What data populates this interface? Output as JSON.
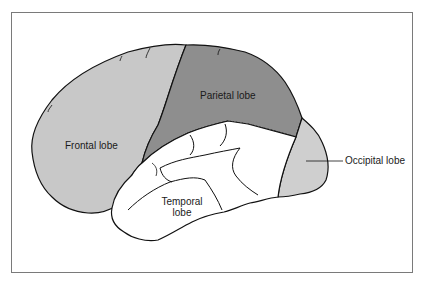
{
  "figure": {
    "type": "lateral-view brain diagram",
    "labels": {
      "frontal": "Frontal lobe",
      "parietal": "Parietal lobe",
      "temporal_line1": "Temporal",
      "temporal_line2": "lobe",
      "occipital": "Occipital lobe"
    },
    "colors": {
      "frontal": "#c8c8c8",
      "parietal": "#8e8e8e",
      "temporal": "#ffffff",
      "occipital": "#cfcfcf",
      "outline": "#111111",
      "frame": "#7a7a7a"
    }
  }
}
